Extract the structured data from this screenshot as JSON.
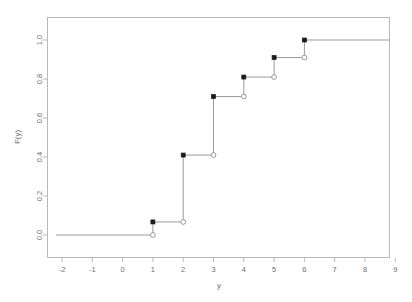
{
  "chart_data": {
    "type": "line",
    "subtype": "step-ecdf",
    "title": "",
    "xlabel": "y",
    "ylabel": "F(y)",
    "xlim": [
      -2.2,
      9.4
    ],
    "ylim": [
      -0.03,
      1.06
    ],
    "grid": false,
    "legend": null,
    "x_ticks": [
      -2,
      -1,
      0,
      1,
      2,
      3,
      4,
      5,
      6,
      7,
      8,
      9
    ],
    "x_tick_labels": [
      "-2",
      "-1",
      "0",
      "1",
      "2",
      "3",
      "4",
      "5",
      "6",
      "7",
      "8",
      "9"
    ],
    "y_ticks": [
      0.0,
      0.2,
      0.4,
      0.6,
      0.8,
      1.0
    ],
    "y_tick_labels": [
      "0.0",
      "0.2",
      "0.4",
      "0.6",
      "0.8",
      "1.0"
    ],
    "jump_points": [
      1,
      2,
      3,
      4,
      5,
      6
    ],
    "cdf_values": [
      0.067,
      0.41,
      0.71,
      0.81,
      0.91,
      1.0
    ],
    "segments": [
      {
        "x_start": -2.2,
        "x_end": 1,
        "value": 0.0,
        "closed_left": false,
        "open_right": true
      },
      {
        "x_start": 1,
        "x_end": 2,
        "value": 0.067,
        "closed_left": true,
        "open_right": true
      },
      {
        "x_start": 2,
        "x_end": 3,
        "value": 0.41,
        "closed_left": true,
        "open_right": true
      },
      {
        "x_start": 3,
        "x_end": 4,
        "value": 0.71,
        "closed_left": true,
        "open_right": true
      },
      {
        "x_start": 4,
        "x_end": 5,
        "value": 0.81,
        "closed_left": true,
        "open_right": true
      },
      {
        "x_start": 5,
        "x_end": 6,
        "value": 0.91,
        "closed_left": true,
        "open_right": true
      },
      {
        "x_start": 6,
        "x_end": 9.4,
        "value": 1.0,
        "closed_left": true,
        "open_right": false
      }
    ],
    "colors": {
      "line": "#8f8f8f",
      "closed_marker": "#1a1a1a",
      "open_marker_fill": "#ffffff",
      "open_marker_stroke": "#8f8f8f",
      "axis": "#b9b9b9",
      "text": "#6d6d6d",
      "background": "#ffffff"
    }
  }
}
